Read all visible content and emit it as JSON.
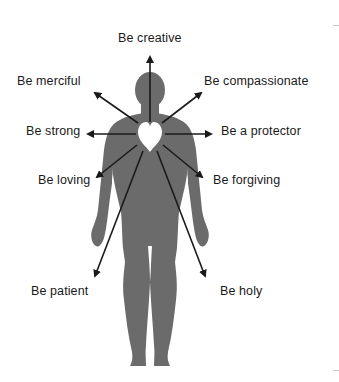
{
  "diagram": {
    "colors": {
      "body": "#6b6b6b",
      "heart": "#ffffff",
      "arrow": "#1a1a1a",
      "text": "#1a1a1a",
      "background": "#ffffff"
    },
    "center_icon": "heart-icon",
    "figure": "human-body-silhouette",
    "labels": [
      {
        "id": "creative",
        "text": "Be creative",
        "x": 118,
        "y": 31
      },
      {
        "id": "merciful",
        "text": "Be merciful",
        "x": 17,
        "y": 74
      },
      {
        "id": "compassionate",
        "text": "Be compassionate",
        "x": 204,
        "y": 74
      },
      {
        "id": "strong",
        "text": "Be strong",
        "x": 26,
        "y": 124
      },
      {
        "id": "protector",
        "text": "Be a protector",
        "x": 221,
        "y": 124
      },
      {
        "id": "loving",
        "text": "Be loving",
        "x": 38,
        "y": 173
      },
      {
        "id": "forgiving",
        "text": "Be forgiving",
        "x": 213,
        "y": 173
      },
      {
        "id": "patient",
        "text": "Be patient",
        "x": 31,
        "y": 284
      },
      {
        "id": "holy",
        "text": "Be holy",
        "x": 220,
        "y": 284
      }
    ]
  }
}
